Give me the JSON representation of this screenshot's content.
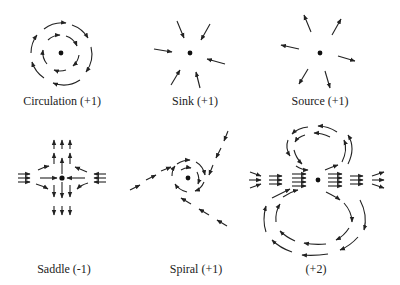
{
  "colors": {
    "stroke": "#222222",
    "background": "#ffffff"
  },
  "panels": [
    {
      "id": "circulation",
      "label": "Circulation (+1)",
      "index": "+1",
      "type": "circulation",
      "direction": "clockwise"
    },
    {
      "id": "sink",
      "label": "Sink (+1)",
      "index": "+1",
      "type": "sink"
    },
    {
      "id": "source",
      "label": "Source (+1)",
      "index": "+1",
      "type": "source"
    },
    {
      "id": "saddle",
      "label": "Saddle (-1)",
      "index": "-1",
      "type": "saddle"
    },
    {
      "id": "spiral",
      "label": "Spiral (+1)",
      "index": "+1",
      "type": "spiral"
    },
    {
      "id": "dipole",
      "label": "(+2)",
      "index": "+2",
      "type": "double-loop"
    }
  ]
}
